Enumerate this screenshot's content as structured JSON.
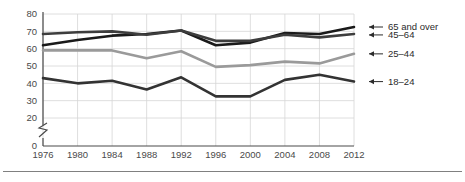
{
  "chart_data": {
    "type": "line",
    "title": "",
    "subtitle": "",
    "xlabel": "",
    "ylabel": "",
    "x": [
      1976,
      1980,
      1984,
      1988,
      1992,
      1996,
      2000,
      2004,
      2008,
      2012
    ],
    "xtick_labels": [
      "1976",
      "1980",
      "1984",
      "1988",
      "1992",
      "1996",
      "2000",
      "2004",
      "2008",
      "2012"
    ],
    "ytick_labels": [
      "0",
      "20",
      "30",
      "40",
      "50",
      "60",
      "70",
      "80"
    ],
    "ytick_values": [
      0,
      20,
      30,
      40,
      50,
      60,
      70,
      80
    ],
    "ylim": [
      0,
      80
    ],
    "y_axis_break": true,
    "y_axis_break_between": [
      0,
      20
    ],
    "grid": true,
    "legend_position": "right-inline",
    "series": [
      {
        "name": "65 and over",
        "color": "#1a1a1a",
        "stroke_width": 2.6,
        "label": "65 and over",
        "values": [
          62,
          65,
          67.5,
          68.5,
          70.5,
          62,
          63.5,
          69,
          68.5,
          72.5
        ]
      },
      {
        "name": "45-64",
        "color": "#3d3d3d",
        "stroke_width": 2.6,
        "label": "45–64",
        "values": [
          68.5,
          69.5,
          70,
          68,
          70.5,
          64.5,
          64.5,
          68,
          66.5,
          68.5
        ]
      },
      {
        "name": "25-44",
        "color": "#9a9a9a",
        "stroke_width": 2.6,
        "label": "25–44",
        "values": [
          59,
          59,
          59,
          54.5,
          58.5,
          49.5,
          50.5,
          52.5,
          51.5,
          57
        ]
      },
      {
        "name": "18-24",
        "color": "#333333",
        "stroke_width": 2.6,
        "label": "18–24",
        "values": [
          43,
          40,
          41.5,
          36.5,
          43.5,
          32.5,
          32.5,
          42,
          45,
          41
        ]
      }
    ]
  },
  "legend": {
    "entries": [
      {
        "label": "65 and over",
        "arrow": "left-arrow-icon"
      },
      {
        "label": "45–64",
        "arrow": "left-arrow-icon"
      },
      {
        "label": "25–44",
        "arrow": "left-arrow-icon"
      },
      {
        "label": "18–24",
        "arrow": "left-arrow-icon"
      }
    ]
  }
}
